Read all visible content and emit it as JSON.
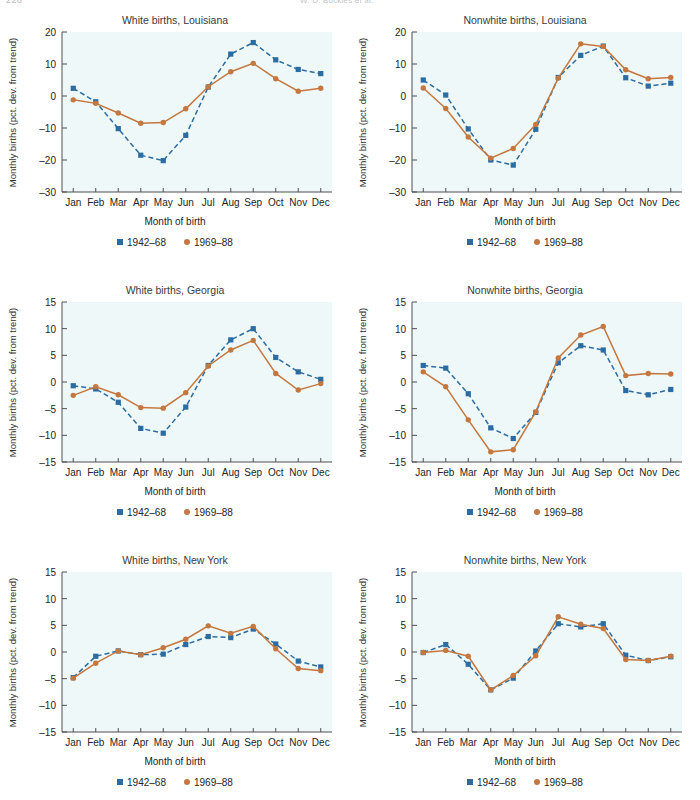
{
  "header": {
    "page_number": "226",
    "running_head": "W. D. Buckles et al."
  },
  "common": {
    "xlabel": "Month of birth",
    "ylabel": "Monthly births (pct. dev. from trend)",
    "months": [
      "Jan",
      "Feb",
      "Mar",
      "Apr",
      "May",
      "Jun",
      "Jul",
      "Aug",
      "Sep",
      "Oct",
      "Nov",
      "Dec"
    ],
    "legend": [
      {
        "label": "1942–68",
        "marker": "square",
        "color": "#2b6ca3",
        "style": "dashed"
      },
      {
        "label": "1969–88",
        "marker": "circle",
        "color": "#c4773f",
        "style": "solid"
      }
    ],
    "colors": {
      "series1": "#2b6ca3",
      "series2": "#c4773f",
      "plot_background": "#eff8f8",
      "axis": "#4f4f52"
    }
  },
  "chart_data": [
    {
      "id": "white-louisiana",
      "type": "line",
      "title": "White births, Louisiana",
      "xlabel": "Month of birth",
      "ylabel": "Monthly births (pct. dev. from trend)",
      "categories": [
        "Jan",
        "Feb",
        "Mar",
        "Apr",
        "May",
        "Jun",
        "Jul",
        "Aug",
        "Sep",
        "Oct",
        "Nov",
        "Dec"
      ],
      "ylim": [
        -30,
        20
      ],
      "yticks": [
        -30,
        -20,
        -10,
        0,
        10,
        20
      ],
      "grid": false,
      "legend_position": "below",
      "series": [
        {
          "name": "1942–68",
          "style": "dashed",
          "marker": "square",
          "color": "#2b6ca3",
          "values": [
            2.4,
            -1.8,
            -10.2,
            -18.5,
            -20.2,
            -12.3,
            2.8,
            13.1,
            16.7,
            11.3,
            8.3,
            7.0
          ]
        },
        {
          "name": "1969–88",
          "style": "solid",
          "marker": "circle",
          "color": "#c4773f",
          "values": [
            -1.2,
            -2.3,
            -5.3,
            -8.5,
            -8.3,
            -4.0,
            2.9,
            7.6,
            10.2,
            5.4,
            1.5,
            2.4
          ]
        }
      ]
    },
    {
      "id": "nonwhite-louisiana",
      "type": "line",
      "title": "Nonwhite births, Louisiana",
      "xlabel": "Month of birth",
      "ylabel": "Monthly births (pct. dev. from trend)",
      "categories": [
        "Jan",
        "Feb",
        "Mar",
        "Apr",
        "May",
        "Jun",
        "Jul",
        "Aug",
        "Sep",
        "Oct",
        "Nov",
        "Dec"
      ],
      "ylim": [
        -30,
        20
      ],
      "yticks": [
        -30,
        -20,
        -10,
        0,
        10,
        20
      ],
      "grid": false,
      "legend_position": "below",
      "series": [
        {
          "name": "1942–68",
          "style": "dashed",
          "marker": "square",
          "color": "#2b6ca3",
          "values": [
            5.0,
            0.3,
            -10.3,
            -20.0,
            -21.6,
            -10.4,
            5.8,
            12.7,
            15.6,
            5.7,
            3.1,
            4.0
          ]
        },
        {
          "name": "1969–88",
          "style": "solid",
          "marker": "circle",
          "color": "#c4773f",
          "values": [
            2.5,
            -3.9,
            -12.8,
            -19.4,
            -16.4,
            -8.9,
            5.6,
            16.3,
            15.5,
            8.2,
            5.4,
            5.8
          ]
        }
      ]
    },
    {
      "id": "white-georgia",
      "type": "line",
      "title": "White births, Georgia",
      "xlabel": "Month of birth",
      "ylabel": "Monthly births (pct. dev. from trend)",
      "categories": [
        "Jan",
        "Feb",
        "Mar",
        "Apr",
        "May",
        "Jun",
        "Jul",
        "Aug",
        "Sep",
        "Oct",
        "Nov",
        "Dec"
      ],
      "ylim": [
        -15,
        15
      ],
      "yticks": [
        -15,
        -10,
        -5,
        0,
        5,
        10,
        15
      ],
      "grid": false,
      "legend_position": "below",
      "series": [
        {
          "name": "1942–68",
          "style": "dashed",
          "marker": "square",
          "color": "#2b6ca3",
          "values": [
            -0.7,
            -1.3,
            -3.8,
            -8.7,
            -9.6,
            -4.7,
            3.1,
            7.9,
            10.0,
            4.6,
            1.9,
            0.5
          ]
        },
        {
          "name": "1969–88",
          "style": "solid",
          "marker": "circle",
          "color": "#c4773f",
          "values": [
            -2.5,
            -0.9,
            -2.4,
            -4.8,
            -4.9,
            -2.0,
            3.0,
            6.0,
            7.8,
            1.6,
            -1.5,
            -0.3
          ]
        }
      ]
    },
    {
      "id": "nonwhite-georgia",
      "type": "line",
      "title": "Nonwhite births, Georgia",
      "xlabel": "Month of birth",
      "ylabel": "Monthly births (pct. dev. from trend)",
      "categories": [
        "Jan",
        "Feb",
        "Mar",
        "Apr",
        "May",
        "Jun",
        "Jul",
        "Aug",
        "Sep",
        "Oct",
        "Nov",
        "Dec"
      ],
      "ylim": [
        -15,
        15
      ],
      "yticks": [
        -15,
        -10,
        -5,
        0,
        5,
        10,
        15
      ],
      "grid": false,
      "legend_position": "below",
      "series": [
        {
          "name": "1942–68",
          "style": "dashed",
          "marker": "square",
          "color": "#2b6ca3",
          "values": [
            3.1,
            2.6,
            -2.2,
            -8.6,
            -10.6,
            -5.7,
            3.6,
            6.8,
            6.0,
            -1.6,
            -2.4,
            -1.4
          ]
        },
        {
          "name": "1969–88",
          "style": "solid",
          "marker": "circle",
          "color": "#c4773f",
          "values": [
            1.9,
            -0.9,
            -7.1,
            -13.1,
            -12.7,
            -5.6,
            4.5,
            8.8,
            10.4,
            1.2,
            1.6,
            1.5
          ]
        }
      ]
    },
    {
      "id": "white-newyork",
      "type": "line",
      "title": "White births, New York",
      "xlabel": "Month of birth",
      "ylabel": "Monthly births (pct. dev. from trend)",
      "categories": [
        "Jan",
        "Feb",
        "Mar",
        "Apr",
        "May",
        "Jun",
        "Jul",
        "Aug",
        "Sep",
        "Oct",
        "Nov",
        "Dec"
      ],
      "ylim": [
        -15,
        15
      ],
      "yticks": [
        -15,
        -10,
        -5,
        0,
        5,
        10,
        15
      ],
      "grid": false,
      "legend_position": "below",
      "series": [
        {
          "name": "1942–68",
          "style": "dashed",
          "marker": "square",
          "color": "#2b6ca3",
          "values": [
            -4.8,
            -0.8,
            0.2,
            -0.5,
            -0.4,
            1.4,
            2.9,
            2.7,
            4.3,
            1.5,
            -1.7,
            -2.8
          ]
        },
        {
          "name": "1969–88",
          "style": "solid",
          "marker": "circle",
          "color": "#c4773f",
          "values": [
            -4.9,
            -2.1,
            0.2,
            -0.5,
            0.8,
            2.4,
            4.9,
            3.5,
            4.8,
            0.6,
            -3.1,
            -3.5
          ]
        }
      ]
    },
    {
      "id": "nonwhite-newyork",
      "type": "line",
      "title": "Nonwhite births, New York",
      "xlabel": "Month of birth",
      "ylabel": "Monthly births (pct. dev. from trend)",
      "categories": [
        "Jan",
        "Feb",
        "Mar",
        "Apr",
        "May",
        "Jun",
        "Jul",
        "Aug",
        "Sep",
        "Oct",
        "Nov",
        "Dec"
      ],
      "ylim": [
        -15,
        15
      ],
      "yticks": [
        -15,
        -10,
        -5,
        0,
        5,
        10,
        15
      ],
      "grid": false,
      "legend_position": "below",
      "series": [
        {
          "name": "1942–68",
          "style": "dashed",
          "marker": "square",
          "color": "#2b6ca3",
          "values": [
            -0.1,
            1.4,
            -2.3,
            -7.1,
            -4.9,
            0.2,
            5.3,
            4.7,
            5.3,
            -0.6,
            -1.6,
            -0.9
          ]
        },
        {
          "name": "1969–88",
          "style": "solid",
          "marker": "circle",
          "color": "#c4773f",
          "values": [
            -0.1,
            0.3,
            -0.8,
            -7.1,
            -4.4,
            -0.7,
            6.6,
            5.2,
            4.4,
            -1.4,
            -1.6,
            -0.8
          ]
        }
      ]
    }
  ]
}
